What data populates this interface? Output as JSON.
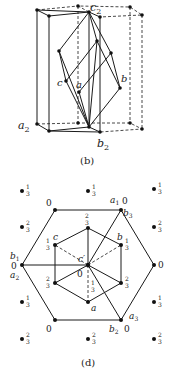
{
  "figure_b": {
    "caption": "(b)",
    "labels": {
      "c2": "c",
      "c2_sub": "2",
      "a2": "a",
      "a2_sub": "2",
      "b2": "b",
      "b2_sub": "2",
      "a": "a",
      "b": "b",
      "c": "c"
    }
  },
  "figure_d": {
    "caption": "(d)",
    "labels": {
      "a1": "a",
      "a1_sub": "1",
      "b3": "b",
      "b3_sub": "3",
      "b1": "b",
      "b1_sub": "1",
      "a2": "a",
      "a2_sub": "2",
      "a3": "a",
      "a3_sub": "3",
      "b2": "b",
      "b2_sub": "2",
      "a": "a",
      "b": "b",
      "c": "c",
      "c_prime": "c′"
    },
    "heights": {
      "zero": "0",
      "one_third_num": "1",
      "two_third_num": "2",
      "denom": "3"
    },
    "outer_points": [
      {
        "pos": "top-left-1",
        "height": "1/3"
      },
      {
        "pos": "top-mid",
        "height": "1/3"
      },
      {
        "pos": "top-right",
        "height": "1/3"
      },
      {
        "pos": "left-2",
        "height": "2/3"
      },
      {
        "pos": "right-2",
        "height": "2/3"
      },
      {
        "pos": "left-4",
        "height": "1/3"
      },
      {
        "pos": "right-4",
        "height": "1/3"
      },
      {
        "pos": "bottom-left",
        "height": "2/3"
      },
      {
        "pos": "bottom-mid",
        "height": "2/3"
      },
      {
        "pos": "bottom-right",
        "height": "2/3"
      }
    ]
  }
}
